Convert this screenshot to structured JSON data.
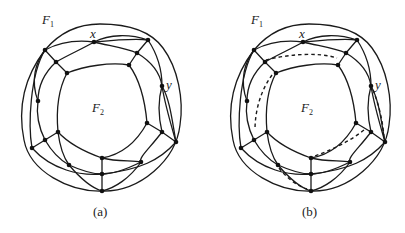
{
  "figure": {
    "panels": [
      {
        "id": "a",
        "caption": "(a)",
        "face_outer": {
          "letter": "F",
          "sub": "1"
        },
        "face_inner": {
          "letter": "F",
          "sub": "2"
        },
        "vertex_x_label": "x",
        "vertex_y_label": "y",
        "has_dashed_paths": false
      },
      {
        "id": "b",
        "caption": "(b)",
        "face_outer": {
          "letter": "F",
          "sub": "1"
        },
        "face_inner": {
          "letter": "F",
          "sub": "2"
        },
        "vertex_x_label": "x",
        "vertex_y_label": "y",
        "has_dashed_paths": true
      }
    ]
  }
}
